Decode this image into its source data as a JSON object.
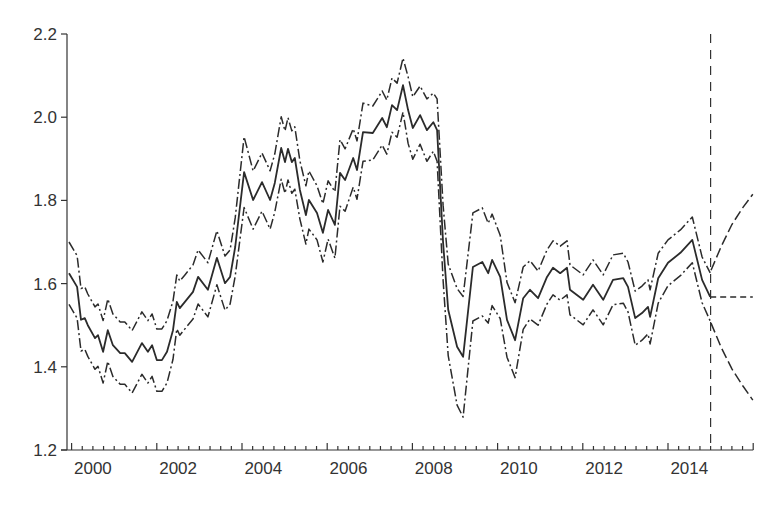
{
  "chart_data": {
    "type": "line",
    "title": "",
    "xlabel": "",
    "ylabel": "",
    "xlim": [
      1999.9,
      2016.0
    ],
    "ylim": [
      1.2,
      2.2
    ],
    "grid": false,
    "legend": null,
    "x_tick_labels": [
      "2000",
      "2002",
      "2004",
      "2006",
      "2008",
      "2010",
      "2012",
      "2014"
    ],
    "y_tick_labels": [
      "1.2",
      "1.4",
      "1.6",
      "1.8",
      "2.0",
      "2.2"
    ],
    "y_ticks": [
      1.2,
      1.4,
      1.6,
      1.8,
      2.0,
      2.2
    ],
    "x_minor_tick_step": 0.25,
    "forecast_origin": 2015.0,
    "annotations": [
      "vertical dashed line marking forecast origin at end of 2014"
    ],
    "series": [
      {
        "name": "estimate",
        "style": "solid",
        "points": [
          [
            1999.94,
            1.625,
            0.075
          ],
          [
            2000.13,
            1.592,
            0.075
          ],
          [
            2000.22,
            1.513,
            0.075
          ],
          [
            2000.31,
            1.517,
            0.075
          ],
          [
            2000.38,
            1.5,
            0.075
          ],
          [
            2000.55,
            1.469,
            0.075
          ],
          [
            2000.62,
            1.476,
            0.075
          ],
          [
            2000.74,
            1.436,
            0.075
          ],
          [
            2000.85,
            1.488,
            0.075
          ],
          [
            2000.97,
            1.452,
            0.075
          ],
          [
            2001.14,
            1.433,
            0.075
          ],
          [
            2001.25,
            1.433,
            0.075
          ],
          [
            2001.42,
            1.412,
            0.075
          ],
          [
            2001.65,
            1.457,
            0.075
          ],
          [
            2001.79,
            1.436,
            0.075
          ],
          [
            2001.89,
            1.452,
            0.075
          ],
          [
            2002.0,
            1.416,
            0.075
          ],
          [
            2002.12,
            1.416,
            0.075
          ],
          [
            2002.24,
            1.436,
            0.075
          ],
          [
            2002.38,
            1.488,
            0.07
          ],
          [
            2002.47,
            1.556,
            0.065
          ],
          [
            2002.54,
            1.541,
            0.065
          ],
          [
            2002.66,
            1.556,
            0.065
          ],
          [
            2002.85,
            1.58,
            0.065
          ],
          [
            2002.97,
            1.616,
            0.065
          ],
          [
            2003.2,
            1.585,
            0.065
          ],
          [
            2003.41,
            1.662,
            0.065
          ],
          [
            2003.6,
            1.601,
            0.065
          ],
          [
            2003.72,
            1.616,
            0.065
          ],
          [
            2003.84,
            1.688,
            0.07
          ],
          [
            2004.05,
            1.868,
            0.085
          ],
          [
            2004.26,
            1.801,
            0.07
          ],
          [
            2004.47,
            1.844,
            0.07
          ],
          [
            2004.66,
            1.801,
            0.07
          ],
          [
            2004.77,
            1.842,
            0.07
          ],
          [
            2004.92,
            1.926,
            0.075
          ],
          [
            2005.01,
            1.892,
            0.075
          ],
          [
            2005.08,
            1.924,
            0.075
          ],
          [
            2005.17,
            1.892,
            0.075
          ],
          [
            2005.24,
            1.902,
            0.075
          ],
          [
            2005.36,
            1.825,
            0.07
          ],
          [
            2005.5,
            1.765,
            0.07
          ],
          [
            2005.57,
            1.801,
            0.07
          ],
          [
            2005.76,
            1.77,
            0.065
          ],
          [
            2005.9,
            1.722,
            0.07
          ],
          [
            2006.02,
            1.777,
            0.07
          ],
          [
            2006.18,
            1.741,
            0.08
          ],
          [
            2006.3,
            1.866,
            0.08
          ],
          [
            2006.42,
            1.849,
            0.075
          ],
          [
            2006.61,
            1.902,
            0.07
          ],
          [
            2006.7,
            1.873,
            0.07
          ],
          [
            2006.84,
            1.964,
            0.07
          ],
          [
            2007.07,
            1.962,
            0.065
          ],
          [
            2007.29,
            1.998,
            0.065
          ],
          [
            2007.4,
            1.976,
            0.065
          ],
          [
            2007.52,
            2.029,
            0.065
          ],
          [
            2007.64,
            2.017,
            0.065
          ],
          [
            2007.78,
            2.077,
            0.065
          ],
          [
            2007.9,
            2.017,
            0.08
          ],
          [
            2008.01,
            1.974,
            0.075
          ],
          [
            2008.18,
            2.005,
            0.07
          ],
          [
            2008.34,
            1.969,
            0.075
          ],
          [
            2008.49,
            1.988,
            0.07
          ],
          [
            2008.58,
            1.969,
            0.075
          ],
          [
            2008.72,
            1.698,
            0.09
          ],
          [
            2008.84,
            1.537,
            0.11
          ],
          [
            2009.05,
            1.448,
            0.14
          ],
          [
            2009.19,
            1.424,
            0.145
          ],
          [
            2009.42,
            1.64,
            0.13
          ],
          [
            2009.64,
            1.652,
            0.13
          ],
          [
            2009.78,
            1.625,
            0.12
          ],
          [
            2009.87,
            1.657,
            0.11
          ],
          [
            2010.06,
            1.616,
            0.1
          ],
          [
            2010.22,
            1.513,
            0.09
          ],
          [
            2010.41,
            1.464,
            0.09
          ],
          [
            2010.6,
            1.565,
            0.075
          ],
          [
            2010.76,
            1.585,
            0.07
          ],
          [
            2010.95,
            1.565,
            0.065
          ],
          [
            2011.16,
            1.616,
            0.065
          ],
          [
            2011.3,
            1.638,
            0.065
          ],
          [
            2011.47,
            1.625,
            0.065
          ],
          [
            2011.63,
            1.638,
            0.065
          ],
          [
            2011.7,
            1.585,
            0.06
          ],
          [
            2012.01,
            1.561,
            0.06
          ],
          [
            2012.24,
            1.597,
            0.06
          ],
          [
            2012.48,
            1.561,
            0.06
          ],
          [
            2012.71,
            1.609,
            0.06
          ],
          [
            2012.95,
            1.613,
            0.06
          ],
          [
            2013.06,
            1.592,
            0.06
          ],
          [
            2013.23,
            1.517,
            0.065
          ],
          [
            2013.39,
            1.529,
            0.065
          ],
          [
            2013.53,
            1.544,
            0.065
          ],
          [
            2013.58,
            1.52,
            0.065
          ],
          [
            2013.77,
            1.613,
            0.06
          ],
          [
            2014.0,
            1.65,
            0.055
          ],
          [
            2014.29,
            1.674,
            0.055
          ],
          [
            2014.57,
            1.705,
            0.055
          ],
          [
            2014.8,
            1.609,
            0.055
          ],
          [
            2014.99,
            1.568,
            0.058
          ]
        ]
      },
      {
        "name": "forecast",
        "style": "dashed",
        "points": [
          [
            2014.99,
            1.568
          ],
          [
            2015.25,
            1.568
          ],
          [
            2015.5,
            1.568
          ],
          [
            2015.75,
            1.568
          ],
          [
            2015.99,
            1.568
          ]
        ]
      },
      {
        "name": "forecast-upper",
        "style": "dashed",
        "points": [
          [
            2015.01,
            1.632
          ],
          [
            2015.25,
            1.69
          ],
          [
            2015.5,
            1.742
          ],
          [
            2015.75,
            1.782
          ],
          [
            2015.99,
            1.815
          ]
        ]
      },
      {
        "name": "forecast-lower",
        "style": "dashed",
        "points": [
          [
            2015.01,
            1.505
          ],
          [
            2015.25,
            1.446
          ],
          [
            2015.5,
            1.395
          ],
          [
            2015.75,
            1.355
          ],
          [
            2015.99,
            1.32
          ]
        ]
      }
    ]
  }
}
